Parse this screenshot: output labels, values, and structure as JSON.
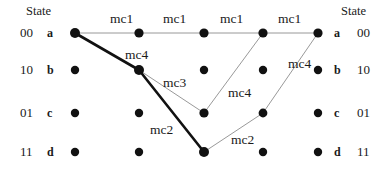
{
  "diagram": {
    "title_left": "State",
    "title_right": "State",
    "type": "trellis",
    "rows": [
      {
        "binary": "00",
        "state": "a",
        "y": 33
      },
      {
        "binary": "10",
        "state": "b",
        "y": 70
      },
      {
        "binary": "01",
        "state": "c",
        "y": 113
      },
      {
        "binary": "11",
        "state": "d",
        "y": 152
      }
    ],
    "columns_x": [
      75,
      139,
      204,
      263,
      318
    ],
    "nodes": [
      {
        "col": 0,
        "row": 0,
        "x": 75,
        "y": 33,
        "r": 5.0,
        "emphasis": "true"
      },
      {
        "col": 0,
        "row": 1,
        "x": 75,
        "y": 70,
        "r": 4.2,
        "emphasis": "false"
      },
      {
        "col": 0,
        "row": 2,
        "x": 75,
        "y": 113,
        "r": 4.2,
        "emphasis": "false"
      },
      {
        "col": 0,
        "row": 3,
        "x": 75,
        "y": 152,
        "r": 4.2,
        "emphasis": "false"
      },
      {
        "col": 1,
        "row": 0,
        "x": 139,
        "y": 33,
        "r": 4.6,
        "emphasis": "false"
      },
      {
        "col": 1,
        "row": 1,
        "x": 139,
        "y": 70,
        "r": 5.0,
        "emphasis": "true"
      },
      {
        "col": 1,
        "row": 2,
        "x": 139,
        "y": 113,
        "r": 4.2,
        "emphasis": "false"
      },
      {
        "col": 1,
        "row": 3,
        "x": 139,
        "y": 152,
        "r": 4.2,
        "emphasis": "false"
      },
      {
        "col": 2,
        "row": 0,
        "x": 204,
        "y": 33,
        "r": 4.6,
        "emphasis": "false"
      },
      {
        "col": 2,
        "row": 1,
        "x": 204,
        "y": 70,
        "r": 4.2,
        "emphasis": "false"
      },
      {
        "col": 2,
        "row": 2,
        "x": 204,
        "y": 113,
        "r": 4.6,
        "emphasis": "false"
      },
      {
        "col": 2,
        "row": 3,
        "x": 204,
        "y": 152,
        "r": 5.0,
        "emphasis": "true"
      },
      {
        "col": 3,
        "row": 0,
        "x": 263,
        "y": 33,
        "r": 4.6,
        "emphasis": "false"
      },
      {
        "col": 3,
        "row": 1,
        "x": 263,
        "y": 70,
        "r": 4.2,
        "emphasis": "false"
      },
      {
        "col": 3,
        "row": 2,
        "x": 263,
        "y": 113,
        "r": 4.4,
        "emphasis": "false"
      },
      {
        "col": 3,
        "row": 3,
        "x": 263,
        "y": 152,
        "r": 4.2,
        "emphasis": "false"
      },
      {
        "col": 4,
        "row": 0,
        "x": 318,
        "y": 33,
        "r": 4.6,
        "emphasis": "false"
      },
      {
        "col": 4,
        "row": 1,
        "x": 318,
        "y": 70,
        "r": 4.2,
        "emphasis": "false"
      },
      {
        "col": 4,
        "row": 2,
        "x": 318,
        "y": 113,
        "r": 4.2,
        "emphasis": "false"
      },
      {
        "col": 4,
        "row": 3,
        "x": 318,
        "y": 152,
        "r": 4.2,
        "emphasis": "false"
      }
    ],
    "edges": [
      {
        "id": "e-a0-a1",
        "x1": 75,
        "y1": 33,
        "x2": 139,
        "y2": 33,
        "weight": "thin",
        "label": "mc1"
      },
      {
        "id": "e-a1-a2",
        "x1": 139,
        "y1": 33,
        "x2": 204,
        "y2": 33,
        "weight": "thin",
        "label": "mc1"
      },
      {
        "id": "e-a2-a3",
        "x1": 204,
        "y1": 33,
        "x2": 263,
        "y2": 33,
        "weight": "thin",
        "label": "mc1"
      },
      {
        "id": "e-a3-a4",
        "x1": 263,
        "y1": 33,
        "x2": 318,
        "y2": 33,
        "weight": "thin",
        "label": "mc1"
      },
      {
        "id": "e-a0-b1",
        "x1": 75,
        "y1": 33,
        "x2": 139,
        "y2": 70,
        "weight": "thick",
        "label": "mc4"
      },
      {
        "id": "e-b1-c2",
        "x1": 139,
        "y1": 70,
        "x2": 204,
        "y2": 113,
        "weight": "thin",
        "label": "mc3"
      },
      {
        "id": "e-b1-d2",
        "x1": 139,
        "y1": 70,
        "x2": 204,
        "y2": 152,
        "weight": "thick",
        "label": "mc2"
      },
      {
        "id": "e-c2-a3",
        "x1": 204,
        "y1": 113,
        "x2": 263,
        "y2": 33,
        "weight": "thin",
        "label": "mc4"
      },
      {
        "id": "e-d2-c3",
        "x1": 204,
        "y1": 152,
        "x2": 263,
        "y2": 113,
        "weight": "thin",
        "label": "mc2"
      },
      {
        "id": "e-c3-a4",
        "x1": 263,
        "y1": 113,
        "x2": 318,
        "y2": 33,
        "weight": "thin",
        "label": "mc4"
      }
    ],
    "edge_labels": [
      {
        "id": "lbl-mc1-1",
        "text": "mc1",
        "x": 110,
        "y": 12
      },
      {
        "id": "lbl-mc1-2",
        "text": "mc1",
        "x": 163,
        "y": 12
      },
      {
        "id": "lbl-mc1-3",
        "text": "mc1",
        "x": 220,
        "y": 12
      },
      {
        "id": "lbl-mc1-4",
        "text": "mc1",
        "x": 278,
        "y": 12
      },
      {
        "id": "lbl-mc4-1",
        "text": "mc4",
        "x": 125,
        "y": 48
      },
      {
        "id": "lbl-mc3-1",
        "text": "mc3",
        "x": 163,
        "y": 76
      },
      {
        "id": "lbl-mc4-2",
        "text": "mc4",
        "x": 228,
        "y": 86
      },
      {
        "id": "lbl-mc4-3",
        "text": "mc4",
        "x": 288,
        "y": 57
      },
      {
        "id": "lbl-mc2-1",
        "text": "mc2",
        "x": 150,
        "y": 123
      },
      {
        "id": "lbl-mc2-2",
        "text": "mc2",
        "x": 231,
        "y": 133
      }
    ],
    "left_axis": {
      "header": "State",
      "header_x": 26,
      "header_y": 11,
      "binary_x": 20,
      "state_x": 47
    },
    "right_axis": {
      "header": "State",
      "header_x": 341,
      "header_y": 11,
      "state_x": 334,
      "binary_x": 357
    },
    "colors": {
      "node_fill": "#111111",
      "edge_thin": "#8d8d8d",
      "edge_thick": "#111111",
      "text": "#1a1a1a",
      "background": "#ffffff"
    }
  }
}
